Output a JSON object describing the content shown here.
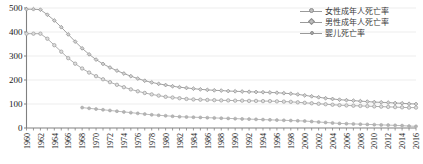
{
  "chart_data": {
    "type": "line",
    "title": "",
    "subtitle": "",
    "xlabel": "",
    "ylabel": "",
    "xlim": [
      1960,
      2016
    ],
    "ylim": [
      0,
      500
    ],
    "yticks": [
      0,
      100,
      200,
      300,
      400,
      500
    ],
    "ytick_labels": [
      "0",
      "100",
      "200",
      "300",
      "400",
      "500"
    ],
    "xtick_labels": [
      "1960",
      "1962",
      "1964",
      "1966",
      "1968",
      "1970",
      "1972",
      "1974",
      "1976",
      "1978",
      "1980",
      "1982",
      "1984",
      "1986",
      "1988",
      "1990",
      "1992",
      "1994",
      "1996",
      "1998",
      "2000",
      "2002",
      "2004",
      "2006",
      "2008",
      "2010",
      "2012",
      "2014",
      "2016"
    ],
    "grid": true,
    "grid_axis": "y",
    "legend_position": "top-right",
    "x": [
      1960,
      1961,
      1962,
      1963,
      1964,
      1965,
      1966,
      1967,
      1968,
      1969,
      1970,
      1971,
      1972,
      1973,
      1974,
      1975,
      1976,
      1977,
      1978,
      1979,
      1980,
      1981,
      1982,
      1983,
      1984,
      1985,
      1986,
      1987,
      1988,
      1989,
      1990,
      1991,
      1992,
      1993,
      1994,
      1995,
      1996,
      1997,
      1998,
      1999,
      2000,
      2001,
      2002,
      2003,
      2004,
      2005,
      2006,
      2007,
      2008,
      2009,
      2010,
      2011,
      2012,
      2013,
      2014,
      2015,
      2016
    ],
    "series": [
      {
        "name": "女性成年人死亡率",
        "marker": "circle",
        "color": "#9a9a9a",
        "values": [
          393,
          393,
          393,
          372,
          345,
          318,
          291,
          268,
          248,
          231,
          216,
          203,
          191,
          180,
          170,
          161,
          153,
          146,
          140,
          135,
          130,
          127,
          124,
          121,
          119,
          118,
          117,
          116,
          115,
          115,
          114,
          114,
          113,
          113,
          112,
          112,
          111,
          110,
          109,
          107,
          105,
          103,
          101,
          99,
          97,
          95,
          94,
          93,
          92,
          91,
          90,
          89,
          88,
          87,
          86,
          85,
          85
        ]
      },
      {
        "name": "男性成年人死亡率",
        "marker": "diamond",
        "color": "#8c8c8c",
        "values": [
          495,
          495,
          493,
          472,
          448,
          420,
          390,
          360,
          332,
          307,
          285,
          267,
          252,
          239,
          227,
          216,
          206,
          197,
          190,
          184,
          179,
          174,
          170,
          167,
          164,
          161,
          159,
          157,
          156,
          154,
          153,
          152,
          151,
          150,
          149,
          148,
          147,
          145,
          143,
          140,
          136,
          132,
          128,
          124,
          121,
          118,
          116,
          114,
          112,
          110,
          108,
          107,
          106,
          104,
          103,
          101,
          100
        ]
      },
      {
        "name": "婴儿死亡率",
        "marker": "dot",
        "color": "#a8a8a8",
        "start_year": 1968,
        "values": [
          null,
          null,
          null,
          null,
          null,
          null,
          null,
          null,
          85,
          82,
          79,
          76,
          73,
          70,
          67,
          64,
          61,
          58,
          55,
          53,
          51,
          49,
          47,
          46,
          45,
          44,
          43,
          42,
          41,
          40,
          39,
          38,
          37,
          36,
          35,
          34,
          33,
          32,
          31,
          30,
          29,
          27,
          25,
          23,
          21,
          19,
          18,
          17,
          16,
          15,
          14,
          13,
          12,
          11,
          10,
          8,
          7
        ]
      }
    ]
  },
  "legend": {
    "items": [
      {
        "label": "女性成年人死亡率",
        "marker": "circle"
      },
      {
        "label": "男性成年人死亡率",
        "marker": "diamond"
      },
      {
        "label": "婴儿死亡率",
        "marker": "dot"
      }
    ]
  },
  "colors": {
    "axis": "#808080",
    "grid": "#ededed",
    "text": "#1a1a1a",
    "series_female": "#9a9a9a",
    "series_male": "#8c8c8c",
    "series_infant": "#a8a8a8",
    "background": "#ffffff"
  }
}
